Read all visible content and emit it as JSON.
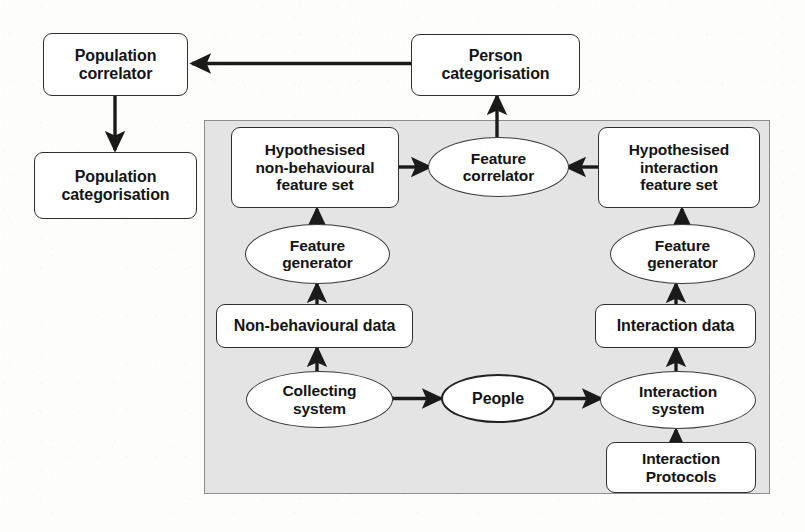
{
  "diagram": {
    "panel": {
      "name": "system-boundary-panel",
      "fill": "#e4e4e4",
      "stroke": "#8d8d8d"
    },
    "colors": {
      "node_fill": "#ffffff",
      "node_stroke": "#2e2e2e",
      "arrow": "#1a1a1a",
      "panel_fill": "#e4e4e4",
      "page_bg": "#fdfdfc"
    },
    "nodes": [
      {
        "id": "population-correlator",
        "shape": "rounded-box",
        "label": "Population\ncorrelator",
        "line1": "Population",
        "line2": "correlator"
      },
      {
        "id": "population-categorisation",
        "shape": "rounded-box",
        "label": "Population\ncategorisation",
        "line1": "Population",
        "line2": "categorisation"
      },
      {
        "id": "person-categorisation",
        "shape": "rounded-box",
        "label": "Person\ncategorisation",
        "line1": "Person",
        "line2": "categorisation"
      },
      {
        "id": "hypothesised-non-behavioural-feature-set",
        "shape": "rounded-box",
        "label": "Hypothesised\nnon-behavioural\nfeature set",
        "line1": "Hypothesised",
        "line2": "non-behavioural",
        "line3": "feature set"
      },
      {
        "id": "hypothesised-interaction-feature-set",
        "shape": "rounded-box",
        "label": "Hypothesised\ninteraction\nfeature set",
        "line1": "Hypothesised",
        "line2": "interaction",
        "line3": "feature set"
      },
      {
        "id": "feature-correlator",
        "shape": "ellipse",
        "label": "Feature\ncorrelator",
        "line1": "Feature",
        "line2": "correlator"
      },
      {
        "id": "feature-generator-left",
        "shape": "ellipse",
        "label": "Feature\ngenerator",
        "line1": "Feature",
        "line2": "generator"
      },
      {
        "id": "feature-generator-right",
        "shape": "ellipse",
        "label": "Feature\ngenerator",
        "line1": "Feature",
        "line2": "generator"
      },
      {
        "id": "non-behavioural-data",
        "shape": "rounded-box",
        "label": "Non-behavioural data",
        "line1": "Non-behavioural data"
      },
      {
        "id": "interaction-data",
        "shape": "rounded-box",
        "label": "Interaction data",
        "line1": "Interaction data"
      },
      {
        "id": "collecting-system",
        "shape": "ellipse",
        "label": "Collecting\nsystem",
        "line1": "Collecting",
        "line2": "system"
      },
      {
        "id": "people",
        "shape": "ellipse",
        "label": "People",
        "line1": "People"
      },
      {
        "id": "interaction-system",
        "shape": "ellipse",
        "label": "Interaction\nsystem",
        "line1": "Interaction",
        "line2": "system"
      },
      {
        "id": "interaction-protocols",
        "shape": "rounded-box",
        "label": "Interaction\nProtocols",
        "line1": "Interaction",
        "line2": "Protocols"
      }
    ],
    "edges": [
      {
        "from": "person-categorisation",
        "to": "population-correlator",
        "kind": "single"
      },
      {
        "from": "population-correlator",
        "to": "population-categorisation",
        "kind": "single"
      },
      {
        "from": "feature-correlator",
        "to": "person-categorisation",
        "kind": "single"
      },
      {
        "from": "hypothesised-non-behavioural-feature-set",
        "to": "feature-correlator",
        "kind": "single"
      },
      {
        "from": "hypothesised-interaction-feature-set",
        "to": "feature-correlator",
        "kind": "single"
      },
      {
        "from": "feature-generator-left",
        "to": "hypothesised-non-behavioural-feature-set",
        "kind": "single"
      },
      {
        "from": "feature-generator-right",
        "to": "hypothesised-interaction-feature-set",
        "kind": "single"
      },
      {
        "from": "non-behavioural-data",
        "to": "feature-generator-left",
        "kind": "single"
      },
      {
        "from": "interaction-data",
        "to": "feature-generator-right",
        "kind": "single"
      },
      {
        "from": "collecting-system",
        "to": "non-behavioural-data",
        "kind": "single"
      },
      {
        "from": "interaction-system",
        "to": "interaction-data",
        "kind": "single"
      },
      {
        "from": "people",
        "to": "collecting-system",
        "kind": "double"
      },
      {
        "from": "people",
        "to": "interaction-system",
        "kind": "double"
      },
      {
        "from": "interaction-protocols",
        "to": "interaction-system",
        "kind": "single"
      }
    ]
  }
}
